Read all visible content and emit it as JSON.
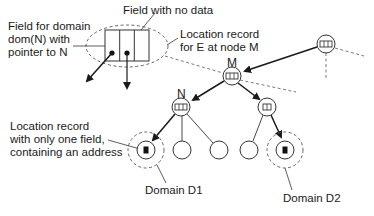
{
  "diagram": {
    "type": "tree-location-records",
    "nodes": {
      "root_right": {
        "label": "",
        "fields": 3
      },
      "M": {
        "label": "M",
        "fields": 3
      },
      "N": {
        "label": "N",
        "fields": 3
      },
      "M_right_child": {
        "label": "",
        "fields": 2
      },
      "leaf_d1": {
        "label": "",
        "fields": 1,
        "domain": "D1"
      },
      "leaf_2": {
        "label": "",
        "fields": 0
      },
      "leaf_3": {
        "label": "",
        "fields": 0
      },
      "leaf_4": {
        "label": "",
        "fields": 0
      },
      "leaf_d2": {
        "label": "",
        "fields": 1,
        "domain": "D2"
      }
    },
    "annotations": {
      "field_no_data": "Field with no data",
      "field_domain": "Field for domain\ndom(N) with\npointer to N",
      "location_record": "Location record\nfor E at node M",
      "one_field": "Location record\nwith only one field,\ncontaining an address",
      "domain_d1": "Domain D1",
      "domain_d2": "Domain D2"
    },
    "colors": {
      "line": "#1a1a1a",
      "dashed": "#555555",
      "background": "#ffffff"
    }
  }
}
